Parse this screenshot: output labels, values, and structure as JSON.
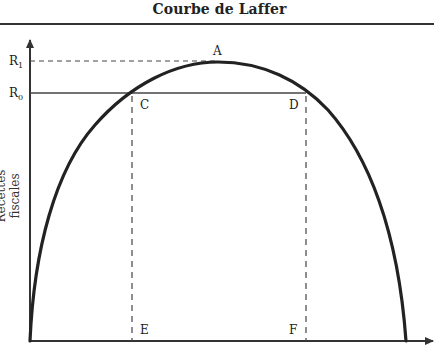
{
  "title": "Courbe de Laffer",
  "axes": {
    "y_label": "Recettes fiscales",
    "x_label": ""
  },
  "levels": {
    "r1": {
      "label": "R",
      "sub": "1",
      "style": "dashed"
    },
    "r0": {
      "label": "R",
      "sub": "0",
      "style": "solid"
    }
  },
  "points": {
    "A": "A",
    "C": "C",
    "D": "D",
    "E": "E",
    "F": "F"
  },
  "colors": {
    "curve": "#222222",
    "axis": "#333333",
    "guide": "#444444"
  }
}
